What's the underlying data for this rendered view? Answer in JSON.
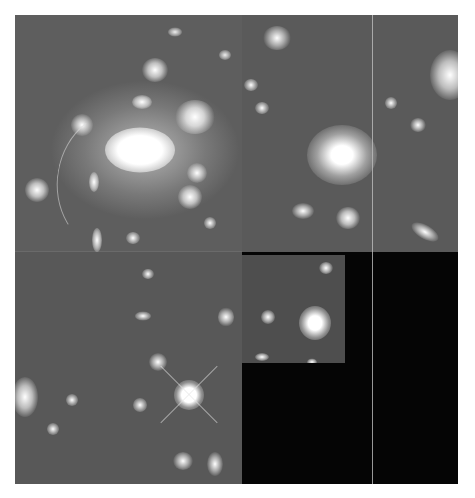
{
  "image": {
    "description": "Grayscale Hubble WFPC2 mosaic of a rich galaxy cluster with gravitational lensing arcs",
    "width": 475,
    "height": 498,
    "background": "#ffffff",
    "mosaic": {
      "x": 15,
      "y": 15,
      "width": 443,
      "height": 469
    },
    "sky_color": "#5a5a5a",
    "blackout_color": "#050505"
  },
  "chips": [
    {
      "name": "top-left-chip",
      "x": 0,
      "y": 0,
      "w": 227,
      "h": 237
    },
    {
      "name": "top-right-chip",
      "x": 227,
      "y": 0,
      "w": 216,
      "h": 237
    },
    {
      "name": "bottom-left-chip",
      "x": 0,
      "y": 237,
      "w": 227,
      "h": 232
    },
    {
      "name": "planetary-camera-inset",
      "x": 227,
      "y": 240,
      "w": 103,
      "h": 108
    }
  ],
  "features": {
    "central_cluster_core": {
      "x": 140,
      "y": 148
    },
    "second_giant_elliptical": {
      "x": 342,
      "y": 155
    },
    "bright_foreground_star": {
      "x": 189,
      "y": 395
    },
    "lensing_arc": {
      "x": 75,
      "y": 200
    }
  }
}
